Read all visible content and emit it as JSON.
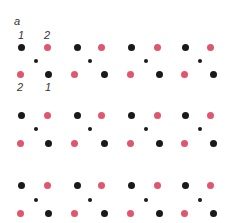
{
  "panel_label": "a",
  "site_labels_top": [
    "1",
    "2"
  ],
  "site_labels_bottom": [
    "2",
    "1"
  ],
  "colors": {
    "black": "#1a1a1a",
    "pink": "#e0566f"
  },
  "lattice": {
    "rows_y": [
      [
        47,
        61,
        74
      ],
      [
        115,
        129,
        143
      ],
      [
        185,
        200,
        213
      ]
    ],
    "top_x": [
      21,
      47,
      77,
      101,
      131,
      157,
      185,
      210
    ],
    "top_colors": [
      "black",
      "pink",
      "black",
      "pink",
      "black",
      "pink",
      "black",
      "pink"
    ],
    "mid_x": [
      36,
      90,
      146,
      200
    ],
    "bottom_x": [
      20,
      48,
      74,
      104,
      130,
      159,
      184,
      213
    ],
    "bottom_colors": [
      "pink",
      "black",
      "pink",
      "black",
      "pink",
      "black",
      "pink",
      "black"
    ],
    "large_diameter": 7,
    "small_diameter": 4
  }
}
